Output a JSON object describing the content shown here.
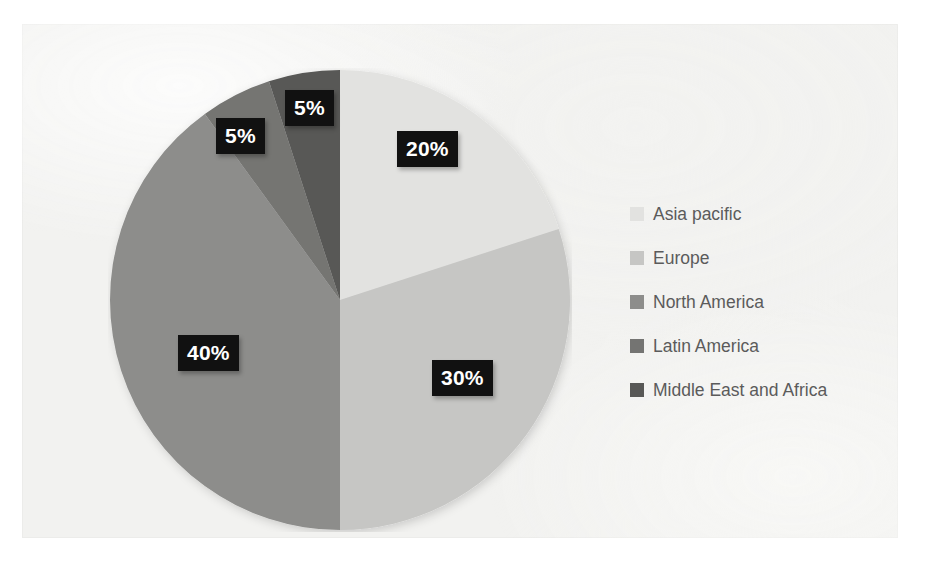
{
  "chart_data": {
    "type": "pie",
    "title": "",
    "subtitle": "",
    "xlabel": "",
    "ylabel": "",
    "grid": false,
    "legend_position": "right",
    "start_angle_deg": 0,
    "direction": "clockwise",
    "categories": [
      "Asia pacific",
      "Europe",
      "North America",
      "Latin America",
      "Middle East and Africa"
    ],
    "values": [
      20,
      30,
      40,
      5,
      5
    ],
    "value_labels": [
      "20%",
      "30%",
      "40%",
      "5%",
      "5%"
    ],
    "colors": [
      "#e2e2e0",
      "#c6c6c4",
      "#8d8d8b",
      "#747472",
      "#585856"
    ],
    "slices": [
      {
        "label": "Asia pacific",
        "value": 20,
        "value_label": "20%",
        "color": "#e2e2e0"
      },
      {
        "label": "Europe",
        "value": 30,
        "value_label": "30%",
        "color": "#c6c6c4"
      },
      {
        "label": "North America",
        "value": 40,
        "value_label": "40%",
        "color": "#8d8d8b"
      },
      {
        "label": "Latin America",
        "value": 5,
        "value_label": "5%",
        "color": "#747472"
      },
      {
        "label": "Middle East and Africa",
        "value": 5,
        "value_label": "5%",
        "color": "#585856"
      }
    ]
  },
  "legend": {
    "items": [
      {
        "label": "Asia pacific",
        "color": "#e2e2e0"
      },
      {
        "label": "Europe",
        "color": "#c6c6c4"
      },
      {
        "label": "North America",
        "color": "#8d8d8b"
      },
      {
        "label": "Latin America",
        "color": "#747472"
      },
      {
        "label": "Middle East and Africa",
        "color": "#585856"
      }
    ]
  },
  "labels": {
    "asia_pacific": "20%",
    "europe": "30%",
    "north_america": "40%",
    "latin_america": "5%",
    "middle_east_africa": "5%"
  },
  "style": {
    "canvas_background": "#f2f2f0",
    "page_background": "#ffffff",
    "label_background": "#111111",
    "label_text_color": "#ffffff",
    "legend_text_color": "#5b5b5b"
  }
}
